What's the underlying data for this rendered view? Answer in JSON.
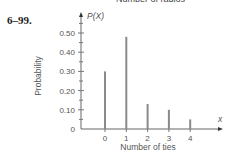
{
  "page": {
    "cut_off_title": "Number of radios",
    "exercise_number": "6–99."
  },
  "chart_data": {
    "type": "bar",
    "title": "",
    "categories": [
      "0",
      "1",
      "2",
      "3",
      "4"
    ],
    "x": [
      0,
      1,
      2,
      3,
      4
    ],
    "values": [
      0.3,
      0.48,
      0.13,
      0.1,
      0.05
    ],
    "xlabel": "Number of ties",
    "ylabel": "Probability",
    "y_axis_symbol": "P(X)",
    "x_axis_symbol": "x",
    "yticks": [
      "0",
      "0.10",
      "0.20",
      "0.30",
      "0.40",
      "0.50"
    ],
    "ylim": [
      0,
      0.55
    ],
    "grid": false,
    "legend": null,
    "bar_style": "thin vertical lines (probability distribution spikes)",
    "bar_color": "#8a8a8a"
  }
}
